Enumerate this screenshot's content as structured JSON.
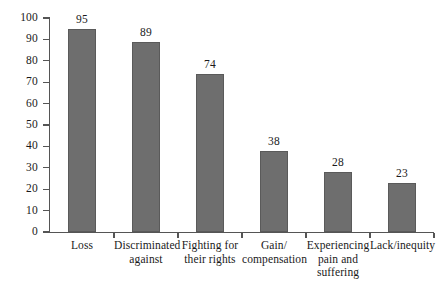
{
  "chart_data": {
    "type": "bar",
    "title": "",
    "subtitle": "",
    "xlabel": "",
    "ylabel": "",
    "ylim": [
      0,
      100
    ],
    "ytick_step": 10,
    "yticks": [
      "100",
      "90",
      "80",
      "70",
      "60",
      "50",
      "40",
      "30",
      "20",
      "10",
      "0"
    ],
    "grid": false,
    "legend": null,
    "bar_color": "#6e6e6e",
    "axis_color": "#555555",
    "categories": [
      "Loss",
      "Discriminated against",
      "Fighting for their rights",
      "Gain/compensation",
      "Experiencing pain and suffering",
      "Lack/inequity"
    ],
    "category_lines": [
      "Loss",
      "Discriminated\nagainst",
      "Fighting for\ntheir rights",
      "Gain/\ncompensation",
      "Experiencing\npain and\nsuffering",
      "Lack/inequity"
    ],
    "values": [
      95,
      89,
      74,
      38,
      28,
      23
    ],
    "value_labels": [
      "95",
      "89",
      "74",
      "38",
      "28",
      "23"
    ]
  }
}
